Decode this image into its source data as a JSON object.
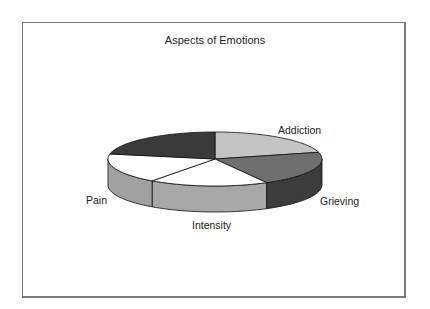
{
  "chart_data": {
    "type": "pie",
    "style": "3d",
    "title": "Aspects of Emotions",
    "categories": [
      "Addiction",
      "Grieving",
      "Intensity",
      "Pain",
      ""
    ],
    "values": [
      21,
      21,
      18,
      18,
      22
    ],
    "unit": "percent (estimated from slice angles)",
    "colors": [
      "#c4c4c4",
      "#6e6e6e",
      "#ffffff",
      "#ffffff",
      "#3a3a3a"
    ],
    "side_colors": [
      "#a0a0a0",
      "#3c3c3c",
      "#a8a8a8",
      "#a0a0a0",
      "#2a2a2a"
    ],
    "start_angle_deg": 0,
    "direction": "clockwise",
    "legend": "none (data labels beside slices)",
    "labels": [
      {
        "text": "Addiction",
        "x": 278,
        "y": 124
      },
      {
        "text": "Grieving",
        "x": 320,
        "y": 195
      },
      {
        "text": "Intensity",
        "x": 192,
        "y": 219
      },
      {
        "text": "Pain",
        "x": 86,
        "y": 194
      }
    ]
  }
}
